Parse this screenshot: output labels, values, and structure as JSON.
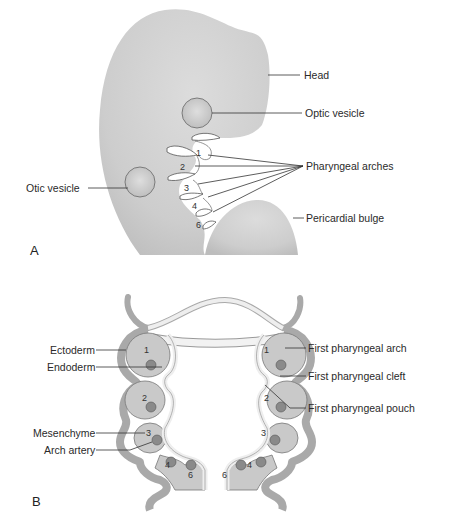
{
  "panel_a": {
    "letter": "A",
    "labels": {
      "head": "Head",
      "optic_vesicle": "Optic vesicle",
      "pharyngeal_arches": "Pharyngeal arches",
      "otic_vesicle": "Otic vesicle",
      "pericardial_bulge": "Pericardial bulge"
    },
    "arch_numbers": [
      "1",
      "2",
      "3",
      "4",
      "6"
    ]
  },
  "panel_b": {
    "letter": "B",
    "labels": {
      "ectoderm": "Ectoderm",
      "endoderm": "Endoderm",
      "mesenchyme": "Mesenchyme",
      "arch_artery": "Arch artery",
      "first_pharyngeal_arch": "First pharyngeal arch",
      "first_pharyngeal_cleft": "First pharyngeal cleft",
      "first_pharyngeal_pouch": "First pharyngeal pouch"
    },
    "arch_numbers": [
      "1",
      "2",
      "3",
      "4",
      "6"
    ]
  },
  "colors": {
    "embryo_fill": "#cfcfcf",
    "ectoderm": "#a9a9a9",
    "mesenchyme": "#c9c9c9",
    "endoderm": "#eeeeee",
    "artery": "#8a8a8a",
    "outline": "#555555"
  }
}
